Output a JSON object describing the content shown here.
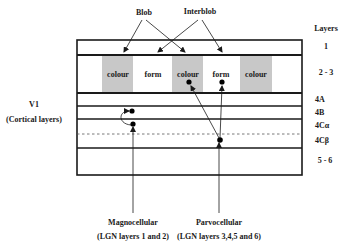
{
  "diagram": {
    "top_labels": {
      "blob": "Blob",
      "interblob": "Interblob"
    },
    "left_label": {
      "title": "V1",
      "subtitle": "(Cortical layers)"
    },
    "layers_header": "Layers",
    "layers": [
      {
        "id": "1",
        "label": "1"
      },
      {
        "id": "2-3",
        "label": "2 - 3"
      },
      {
        "id": "4A",
        "label": "4A"
      },
      {
        "id": "4B",
        "label": "4B"
      },
      {
        "id": "4Calpha",
        "label": "4Cα"
      },
      {
        "id": "4Cbeta",
        "label": "4Cβ"
      },
      {
        "id": "5-6",
        "label": "5 - 6"
      }
    ],
    "columns": [
      {
        "type": "blob",
        "label": "colour"
      },
      {
        "type": "interblob",
        "label": "form"
      },
      {
        "type": "blob",
        "label": "colour"
      },
      {
        "type": "interblob",
        "label": "form"
      },
      {
        "type": "blob",
        "label": "colour"
      }
    ],
    "inputs": {
      "magnocellular": {
        "title": "Magnocellular",
        "subtitle": "(LGN layers 1 and 2)"
      },
      "parvocellular": {
        "title": "Parvocellular",
        "subtitle": "(LGN layers 3,4,5 and 6)"
      }
    },
    "colors": {
      "blob_fill": "#c8c8c8",
      "line": "#1a1a1a",
      "background": "#ffffff"
    }
  }
}
